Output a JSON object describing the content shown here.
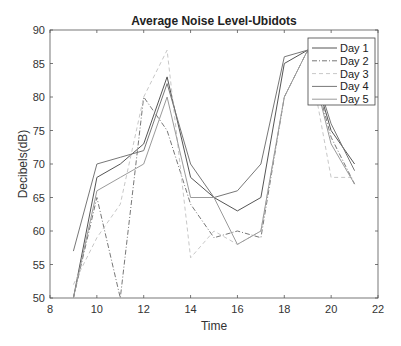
{
  "chart_data": {
    "type": "line",
    "title": "Average Noise Level-Ubidots",
    "xlabel": "Time",
    "ylabel": "Decibels(dB)",
    "xlim": [
      8,
      22
    ],
    "ylim": [
      50,
      90
    ],
    "xticks": [
      8,
      10,
      12,
      14,
      16,
      18,
      20,
      22
    ],
    "yticks": [
      50,
      55,
      60,
      65,
      70,
      75,
      80,
      85,
      90
    ],
    "grid": false,
    "legend_position": "upper right",
    "x": [
      9,
      10,
      11,
      12,
      13,
      14,
      15,
      16,
      17,
      18,
      19,
      20,
      21
    ],
    "series": [
      {
        "name": "Day 1",
        "style": "solid",
        "color": "#555555",
        "values": [
          50,
          68,
          70,
          73,
          83,
          68,
          65,
          63,
          65,
          85,
          87,
          75,
          70
        ]
      },
      {
        "name": "Day 2",
        "style": "dashdot",
        "color": "#777777",
        "values": [
          50,
          65,
          50,
          80,
          75,
          64,
          59,
          60,
          59,
          80,
          87,
          74,
          67
        ]
      },
      {
        "name": "Day 3",
        "style": "dashed",
        "color": "#c8c8c8",
        "values": [
          52,
          59,
          64,
          80,
          87,
          56,
          60,
          58,
          60,
          80,
          87,
          68,
          68
        ]
      },
      {
        "name": "Day 4",
        "style": "solid",
        "color": "#777777",
        "values": [
          57,
          70,
          71,
          72,
          82,
          70,
          65,
          66,
          70,
          86,
          87,
          76,
          69
        ]
      },
      {
        "name": "Day 5",
        "style": "solid",
        "color": "#9a9a9a",
        "values": [
          50,
          66,
          68,
          70,
          80,
          65,
          65,
          58,
          60,
          80,
          87,
          73,
          67
        ]
      }
    ]
  },
  "legend": {
    "items": [
      "Day 1",
      "Day 2",
      "Day 3",
      "Day 4",
      "Day 5"
    ]
  }
}
